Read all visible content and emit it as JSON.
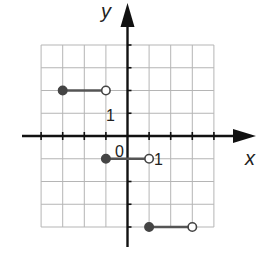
{
  "chart_data": {
    "type": "line",
    "title": "",
    "xlabel": "x",
    "ylabel": "y",
    "xlim": [
      -4,
      4
    ],
    "ylim": [
      -4,
      4
    ],
    "grid": true,
    "tick_labels": {
      "x": [
        "0",
        "1"
      ],
      "y": [
        "1"
      ]
    },
    "origin_label": "0",
    "series": [
      {
        "name": "step-1",
        "x": [
          -3,
          -1
        ],
        "y": [
          2,
          2
        ],
        "start_closed": true,
        "end_closed": false
      },
      {
        "name": "step-2",
        "x": [
          -1,
          1
        ],
        "y": [
          -1,
          -1
        ],
        "start_closed": true,
        "end_closed": false
      },
      {
        "name": "step-3",
        "x": [
          1,
          3
        ],
        "y": [
          -4,
          -4
        ],
        "start_closed": true,
        "end_closed": false
      }
    ],
    "colors": {
      "axis": "#111111",
      "grid": "#b5b5b5",
      "segment": "#555555",
      "dot": "#444444"
    }
  },
  "labels": {
    "x_axis": "x",
    "y_axis": "y",
    "origin": "0",
    "x_unit": "1",
    "y_unit": "1"
  }
}
